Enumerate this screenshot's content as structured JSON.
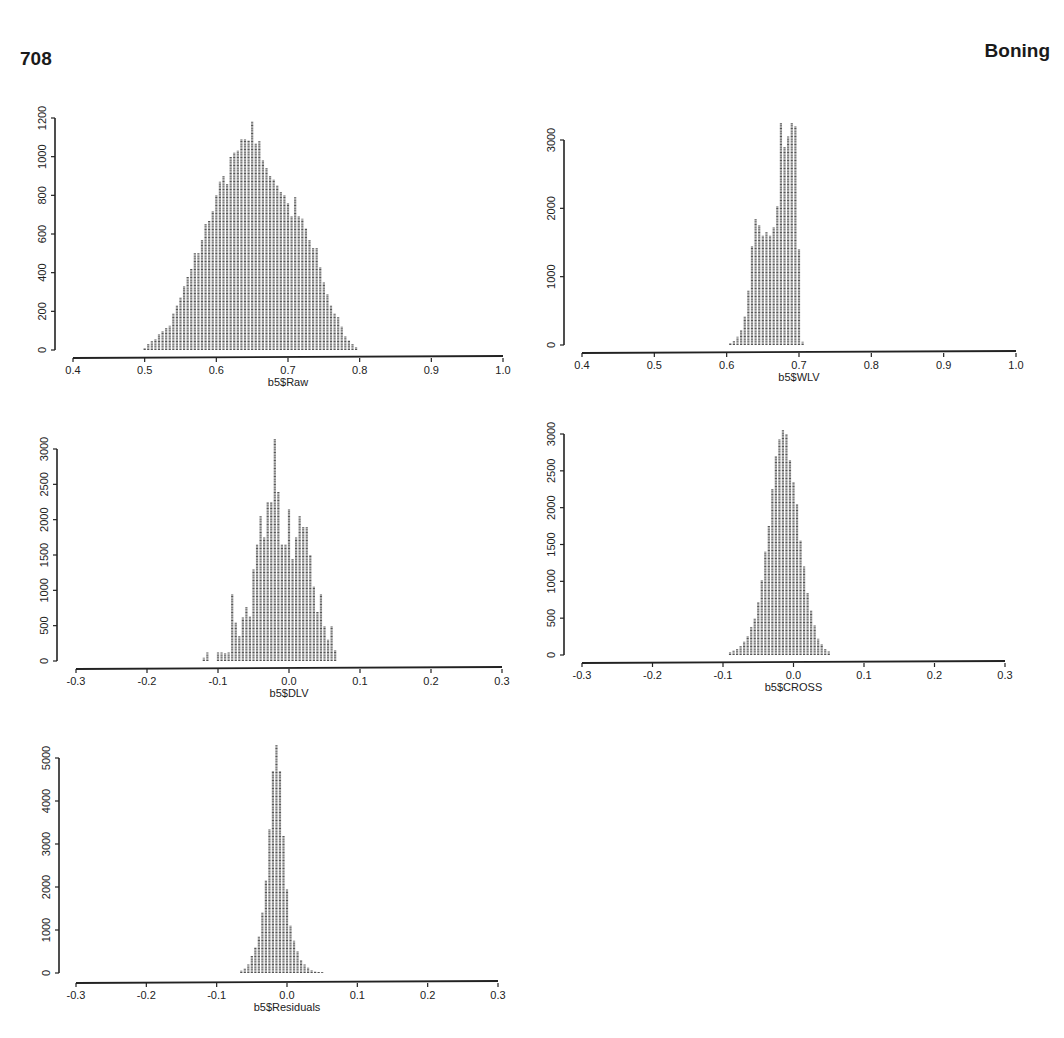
{
  "header": {
    "page_number": "708",
    "running_head": "Boning"
  },
  "chart_data": [
    {
      "type": "bar",
      "title": "",
      "xlabel": "b5$Raw",
      "ylabel": "",
      "xlim": [
        0.4,
        1.0
      ],
      "ylim": [
        0,
        1200
      ],
      "xticks": [
        0.4,
        0.5,
        0.6,
        0.7,
        0.8,
        0.9,
        1.0
      ],
      "xtick_labels": [
        "0.4",
        "0.5",
        "0.6",
        "0.7",
        "0.8",
        "0.9",
        "1.0"
      ],
      "yticks": [
        0,
        200,
        400,
        600,
        800,
        1000,
        1200
      ],
      "ytick_labels": [
        "0",
        "200",
        "400",
        "600",
        "800",
        "1000",
        "1200"
      ],
      "grid": false,
      "bin_start": 0.5,
      "bin_width": 0.005,
      "values": [
        10,
        30,
        45,
        55,
        80,
        100,
        115,
        125,
        190,
        230,
        270,
        330,
        380,
        420,
        500,
        500,
        570,
        650,
        670,
        720,
        800,
        870,
        900,
        860,
        1000,
        1020,
        1030,
        1090,
        1090,
        1085,
        1180,
        1070,
        1080,
        980,
        940,
        900,
        880,
        850,
        820,
        800,
        760,
        690,
        790,
        690,
        680,
        630,
        570,
        530,
        530,
        430,
        350,
        290,
        230,
        190,
        170,
        120,
        70,
        50,
        30,
        15
      ],
      "box": {
        "x0": 73,
        "x1": 503,
        "y_axis_x": 55,
        "y_top": 118,
        "y_bottom": 350,
        "x_axis_y": 358
      }
    },
    {
      "type": "bar",
      "title": "",
      "xlabel": "b5$WLV",
      "ylabel": "",
      "xlim": [
        0.4,
        1.0
      ],
      "ylim": [
        0,
        3000
      ],
      "xticks": [
        0.4,
        0.5,
        0.6,
        0.7,
        0.8,
        0.9,
        1.0
      ],
      "xtick_labels": [
        "0.4",
        "0.5",
        "0.6",
        "0.7",
        "0.8",
        "0.9",
        "1.0"
      ],
      "yticks": [
        0,
        1000,
        2000,
        3000
      ],
      "ytick_labels": [
        "0",
        "1000",
        "2000",
        "3000"
      ],
      "grid": false,
      "bin_start": 0.605,
      "bin_width": 0.005,
      "values": [
        30,
        60,
        120,
        220,
        420,
        800,
        1450,
        1850,
        1750,
        1600,
        1650,
        1600,
        1720,
        2030,
        3250,
        2900,
        3050,
        3250,
        3200,
        1400,
        50
      ],
      "box": {
        "x0": 582,
        "x1": 1016,
        "y_axis_x": 564,
        "y_top": 140,
        "y_bottom": 345,
        "x_axis_y": 353
      }
    },
    {
      "type": "bar",
      "title": "",
      "xlabel": "b5$DLV",
      "ylabel": "",
      "xlim": [
        -0.3,
        0.3
      ],
      "ylim": [
        0,
        3000
      ],
      "xticks": [
        -0.3,
        -0.2,
        -0.1,
        0.0,
        0.1,
        0.2,
        0.3
      ],
      "xtick_labels": [
        "-0.3",
        "-0.2",
        "-0.1",
        "0.0",
        "0.1",
        "0.2",
        "0.3"
      ],
      "yticks": [
        0,
        500,
        1000,
        1500,
        2000,
        2500,
        3000
      ],
      "ytick_labels": [
        "0",
        "500",
        "1000",
        "1500",
        "2000",
        "2500",
        "3000"
      ],
      "grid": false,
      "bin_start": -0.12,
      "bin_width": 0.005,
      "values": [
        50,
        120,
        0,
        0,
        120,
        120,
        110,
        120,
        950,
        550,
        350,
        620,
        770,
        630,
        1300,
        1650,
        2050,
        1750,
        2250,
        2250,
        3150,
        2400,
        1650,
        1650,
        2150,
        1450,
        1750,
        2050,
        1900,
        1900,
        1500,
        1050,
        700,
        950,
        500,
        300,
        500,
        150
      ],
      "box": {
        "x0": 76,
        "x1": 502,
        "y_axis_x": 57,
        "y_top": 449,
        "y_bottom": 661,
        "x_axis_y": 669
      }
    },
    {
      "type": "bar",
      "title": "",
      "xlabel": "b5$CROSS",
      "ylabel": "",
      "xlim": [
        -0.3,
        0.3
      ],
      "ylim": [
        0,
        3000
      ],
      "xticks": [
        -0.3,
        -0.2,
        -0.1,
        0.0,
        0.1,
        0.2,
        0.3
      ],
      "xtick_labels": [
        "-0.3",
        "-0.2",
        "-0.1",
        "0.0",
        "0.1",
        "0.2",
        "0.3"
      ],
      "yticks": [
        0,
        500,
        1000,
        1500,
        2000,
        2500,
        3000
      ],
      "ytick_labels": [
        "0",
        "500",
        "1000",
        "1500",
        "2000",
        "2500",
        "3000"
      ],
      "grid": false,
      "bin_start": -0.09,
      "bin_width": 0.005,
      "values": [
        40,
        60,
        80,
        120,
        180,
        250,
        380,
        500,
        720,
        1020,
        1400,
        1750,
        2250,
        2700,
        2930,
        3050,
        3000,
        2650,
        2350,
        2050,
        1550,
        1200,
        850,
        600,
        400,
        220,
        150,
        80,
        50
      ],
      "box": {
        "x0": 582,
        "x1": 1005,
        "y_axis_x": 564,
        "y_top": 434,
        "y_bottom": 655,
        "x_axis_y": 663
      }
    },
    {
      "type": "bar",
      "title": "",
      "xlabel": "b5$Residuals",
      "ylabel": "",
      "xlim": [
        -0.3,
        0.3
      ],
      "ylim": [
        0,
        5000
      ],
      "xticks": [
        -0.3,
        -0.2,
        -0.1,
        0.0,
        0.1,
        0.2,
        0.3
      ],
      "xtick_labels": [
        "-0.3",
        "-0.2",
        "-0.1",
        "0.0",
        "0.1",
        "0.2",
        "0.3"
      ],
      "yticks": [
        0,
        1000,
        2000,
        3000,
        4000,
        5000
      ],
      "ytick_labels": [
        "0",
        "1000",
        "2000",
        "3000",
        "4000",
        "5000"
      ],
      "grid": false,
      "bin_start": -0.065,
      "bin_width": 0.005,
      "values": [
        50,
        100,
        200,
        400,
        600,
        850,
        1400,
        2150,
        3350,
        4700,
        5300,
        4700,
        3200,
        1950,
        1100,
        750,
        500,
        300,
        200,
        120,
        60,
        40,
        30,
        20
      ],
      "box": {
        "x0": 76,
        "x1": 498,
        "y_axis_x": 59,
        "y_top": 758,
        "y_bottom": 973,
        "x_axis_y": 983
      }
    }
  ]
}
